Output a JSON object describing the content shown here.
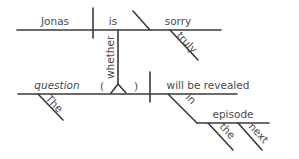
{
  "diagram": {
    "type": "sentence-diagram",
    "sentence": "Jonas is truly sorry whether the question will be revealed in the next episode",
    "main_clause": {
      "subject": "Jonas",
      "verb": "is",
      "predicate_adjective": "sorry",
      "adverb_modifier": "truly"
    },
    "connector": "whether",
    "sub_clause": {
      "subject": "question",
      "subject_modifier": "The",
      "verb": "will be revealed",
      "preposition": "in",
      "object": "episode",
      "object_modifiers": [
        "the",
        "next"
      ],
      "paren_open": "(",
      "paren_close": ")"
    }
  }
}
